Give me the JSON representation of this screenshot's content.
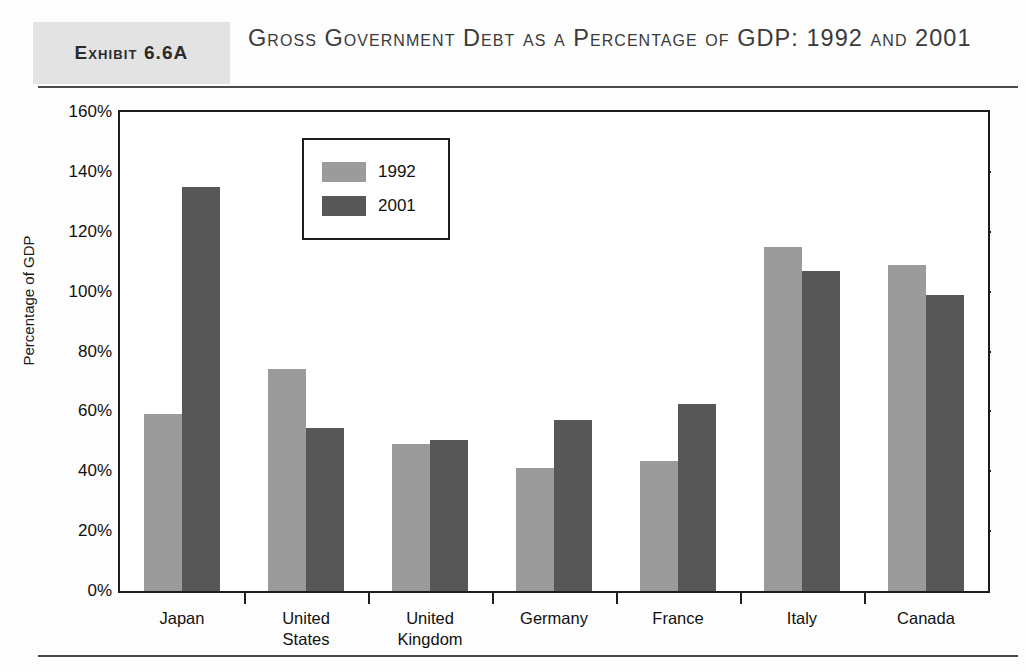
{
  "header": {
    "badge_label": "Exhibit 6.6A",
    "title": "Gross Government Debt as a Percentage of GDP: 1992 and 2001"
  },
  "chart_data": {
    "type": "bar",
    "title": "Gross Government Debt as a Percentage of GDP: 1992 and 2001",
    "xlabel": "",
    "ylabel": "Percentage of GDP",
    "ylim": [
      0,
      160
    ],
    "ytick_labels": [
      "160%",
      "140%",
      "120%",
      "100%",
      "80%",
      "60%",
      "40%",
      "20%",
      "0%"
    ],
    "ytick_values": [
      160,
      140,
      120,
      100,
      80,
      60,
      40,
      20,
      0
    ],
    "grid": false,
    "legend_position": "inside-upper-left",
    "categories": [
      "Japan",
      "United States",
      "United Kingdom",
      "Germany",
      "France",
      "Italy",
      "Canada"
    ],
    "series": [
      {
        "name": "1992",
        "color": "#9b9b9b",
        "values": [
          59,
          74,
          49,
          41,
          43.5,
          115,
          109
        ]
      },
      {
        "name": "2001",
        "color": "#575757",
        "values": [
          135,
          54.5,
          50.5,
          57,
          62.5,
          107,
          99
        ]
      }
    ]
  }
}
